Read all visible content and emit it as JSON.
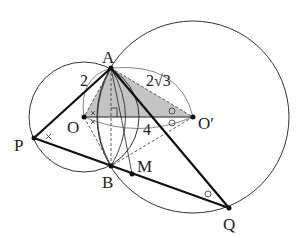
{
  "diagram": {
    "type": "geometry",
    "colors": {
      "stroke": "#222222",
      "shade": "#bdbdbd",
      "thin": "#444444"
    },
    "points": {
      "A": {
        "label": "A",
        "x": 111,
        "y": 68
      },
      "O": {
        "label": "O",
        "x": 84,
        "y": 117
      },
      "O_prime": {
        "label": "O′",
        "x": 193,
        "y": 117
      },
      "P": {
        "label": "P",
        "x": 34,
        "y": 138
      },
      "B": {
        "label": "B",
        "x": 111,
        "y": 166
      },
      "M": {
        "label": "M",
        "x": 132,
        "y": 174
      },
      "Q": {
        "label": "Q",
        "x": 229,
        "y": 208
      }
    },
    "circles": [
      {
        "name": "circle-O",
        "center": "O",
        "radius": 55
      },
      {
        "name": "circle-O-prime",
        "center": "O′",
        "radius": 96
      }
    ],
    "shaded_triangle": [
      "A",
      "O",
      "O′"
    ],
    "measurements": {
      "OA": "2",
      "AO_prime": "2√3",
      "OO_prime": "4"
    },
    "marks": {
      "right_angle_at": "foot of A on OO′",
      "cross_marks": [
        "angle APB",
        "angle AOB halves"
      ],
      "circle_marks": [
        "angle AO′B halves",
        "angle AQB"
      ]
    }
  }
}
